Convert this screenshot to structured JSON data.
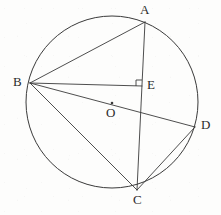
{
  "figure": {
    "background_color": "#fdfdfc",
    "stroke_color": "#3a3a3a",
    "label_color": "#2b2b2b",
    "circle": {
      "center_label": "O",
      "cx": 112,
      "cy": 102,
      "r": 86
    },
    "points": [
      {
        "id": "A",
        "label": "A",
        "x": 145,
        "y": 22,
        "label_x": 140,
        "label_y": 5,
        "on_circle": true
      },
      {
        "id": "B",
        "label": "B",
        "x": 30,
        "y": 83,
        "label_x": 13,
        "label_y": 76,
        "on_circle": true
      },
      {
        "id": "C",
        "label": "C",
        "x": 137,
        "y": 190,
        "label_x": 133,
        "label_y": 194,
        "on_circle": true
      },
      {
        "id": "D",
        "label": "D",
        "x": 195,
        "y": 127,
        "label_x": 201,
        "label_y": 119,
        "on_circle": true
      },
      {
        "id": "E",
        "label": "E",
        "x": 142,
        "y": 86,
        "label_x": 147,
        "label_y": 79,
        "on_circle": false
      },
      {
        "id": "O",
        "label": "O",
        "x": 112,
        "y": 103,
        "label_x": 107,
        "label_y": 107,
        "on_circle": false
      }
    ],
    "segments": [
      {
        "id": "BA",
        "from": "B",
        "to": "A",
        "name": "chord-b-a"
      },
      {
        "id": "AC",
        "from": "A",
        "to": "C",
        "name": "chord-a-c"
      },
      {
        "id": "BC",
        "from": "B",
        "to": "C",
        "name": "chord-b-c"
      },
      {
        "id": "CD",
        "from": "C",
        "to": "D",
        "name": "chord-c-d"
      },
      {
        "id": "BD",
        "from": "B",
        "to": "D",
        "name": "diameter-b-d"
      },
      {
        "id": "BE",
        "from": "B",
        "to": "E",
        "name": "perpendicular-b-e"
      }
    ],
    "right_angle": {
      "at": "E",
      "label": "right-angle-mark",
      "size": 6
    }
  }
}
